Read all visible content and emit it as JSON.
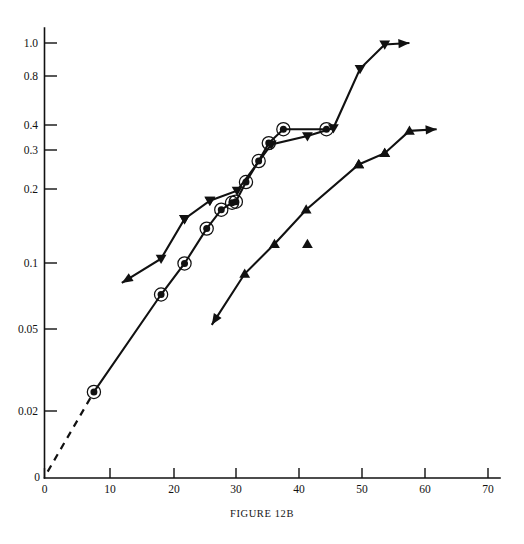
{
  "figure": {
    "caption": "FIGURE 12B",
    "corner_mark": ""
  },
  "chart_data": {
    "type": "line",
    "title": "",
    "subtitle": "",
    "xlabel": "",
    "ylabel": "",
    "yscale": "log",
    "xscale": "linear",
    "xlim": [
      0,
      72
    ],
    "ylim": [
      0.0088,
      1.22
    ],
    "grid": false,
    "legend": null,
    "x_ticks": [
      0,
      10,
      20,
      30,
      40,
      50,
      60,
      70
    ],
    "x_tick_labels": [
      "0",
      "10",
      "20",
      "30",
      "40",
      "50",
      "60",
      "70"
    ],
    "y_ticks": [
      0.02,
      0.05,
      0.1,
      0.2,
      0.3,
      0.4,
      0.8,
      1.0
    ],
    "y_tick_labels": [
      "0.02",
      "0.05",
      "0.1",
      "0.2",
      "0.3",
      "0.4",
      "0.8",
      "1.0"
    ],
    "y_axis_origin_label": "0",
    "series": [
      {
        "name": "circle-marker-series",
        "marker": "circle-with-ring",
        "linestyle": "solid",
        "extrapolation_linestyle": "dashed",
        "extrapolation_points": [
          [
            0.5,
            0.0105
          ],
          [
            7.8,
            0.0245
          ]
        ],
        "points": [
          [
            7.8,
            0.0245
          ],
          [
            18.4,
            0.069
          ],
          [
            22.1,
            0.096
          ],
          [
            25.6,
            0.139
          ],
          [
            27.9,
            0.17
          ],
          [
            29.6,
            0.183
          ],
          [
            30.2,
            0.185
          ],
          [
            31.8,
            0.228
          ],
          [
            33.8,
            0.285
          ],
          [
            35.4,
            0.345
          ],
          [
            37.7,
            0.4
          ],
          [
            44.5,
            0.4
          ]
        ]
      },
      {
        "name": "down-triangle-series",
        "marker": "triangle-down",
        "linestyle": "solid",
        "start_arrow": true,
        "end_arrow": true,
        "points": [
          [
            12.2,
            0.078
          ],
          [
            18.4,
            0.101
          ],
          [
            22.1,
            0.154
          ],
          [
            26.1,
            0.187
          ],
          [
            30.4,
            0.208
          ],
          [
            35.8,
            0.34
          ],
          [
            41.5,
            0.372
          ],
          [
            45.6,
            0.405
          ],
          [
            49.8,
            0.76
          ],
          [
            53.7,
            0.985
          ],
          [
            57.6,
            1.0
          ]
        ],
        "unconnected_markers": [
          [
            22.1,
            0.154
          ],
          [
            26.1,
            0.187
          ]
        ]
      },
      {
        "name": "up-triangle-series",
        "marker": "triangle-up",
        "linestyle": "solid",
        "start_arrow": true,
        "end_arrow": true,
        "points": [
          [
            26.4,
            0.05
          ],
          [
            31.6,
            0.086
          ],
          [
            36.3,
            0.118
          ],
          [
            41.3,
            0.17
          ],
          [
            49.6,
            0.275
          ],
          [
            53.7,
            0.31
          ],
          [
            57.6,
            0.393
          ],
          [
            61.9,
            0.4
          ]
        ],
        "unconnected_markers": [
          [
            41.5,
            0.118
          ],
          [
            49.6,
            0.275
          ],
          [
            53.7,
            0.31
          ]
        ]
      }
    ]
  }
}
